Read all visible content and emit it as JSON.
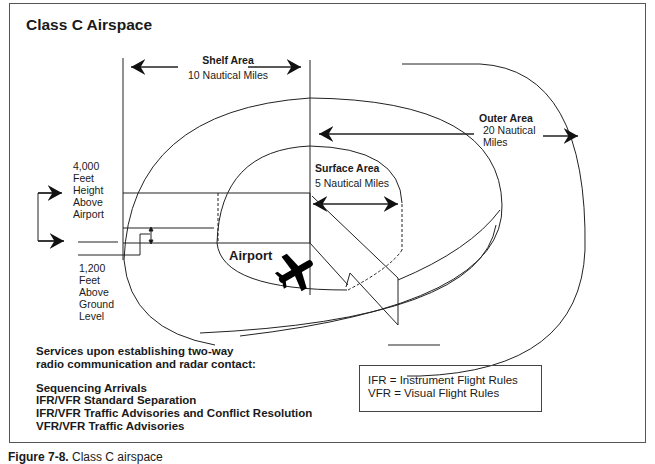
{
  "title": "Class C Airspace",
  "labels": {
    "shelf": {
      "name": "Shelf Area",
      "distance": "10 Nautical Miles"
    },
    "outer": {
      "name": "Outer Area",
      "distance_line1": "20  Nautical",
      "distance_line2": "Miles"
    },
    "surface": {
      "name": "Surface Area",
      "distance": "5 Nautical Miles"
    },
    "airport": "Airport",
    "ceiling": [
      "4,000",
      "Feet",
      "Height",
      "Above",
      "Airport"
    ],
    "shelf_floor": [
      "1,200",
      "Feet",
      "Above",
      "Ground",
      "Level"
    ]
  },
  "services": {
    "heading_line1": "Services upon establishing two-way",
    "heading_line2": "radio communication and radar contact:",
    "items": [
      "Sequencing Arrivals",
      "IFR/VFR Standard Separation",
      "IFR/VFR Traffic Advisories and Conflict Resolution",
      "VFR/VFR Traffic Advisories"
    ]
  },
  "legend": {
    "ifr": "IFR = Instrument Flight Rules",
    "vfr": "VFR = Visual Flight Rules"
  },
  "caption": {
    "figure": "Figure 7-8.",
    "text": "Class C airspace"
  }
}
